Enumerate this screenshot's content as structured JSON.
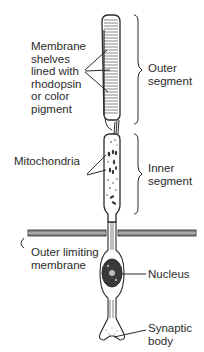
{
  "labels": {
    "membrane_shelves": "Membrane\nshelves\nlined with\nrhodopsin\nor color\npigment",
    "outer_segment": "Outer\nsegment",
    "mitochondria": "Mitochondria",
    "inner_segment": "Inner\nsegment",
    "outer_limiting_membrane": "Outer limiting\nmembrane",
    "nucleus": "Nucleus",
    "synaptic_body": "Synaptic\nbody"
  },
  "colors": {
    "ink": "#2a2a2a",
    "background": "#ffffff"
  }
}
